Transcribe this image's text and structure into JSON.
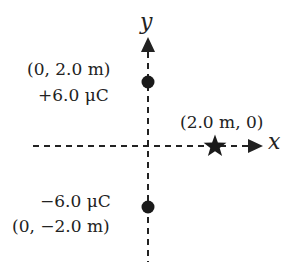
{
  "diagram": {
    "axes": {
      "x_label": "x",
      "y_label": "y",
      "style": "dashed",
      "color": "#222222"
    },
    "charges": [
      {
        "name": "positive-charge",
        "coordinate_label": "(0, 2.0 m)",
        "charge_label": "+6.0 μC",
        "x_m": 0,
        "y_m": 2.0,
        "charge_uC": 6.0,
        "marker": "filled-circle"
      },
      {
        "name": "negative-charge",
        "coordinate_label": "(0, −2.0 m)",
        "charge_label": "−6.0 μC",
        "x_m": 0,
        "y_m": -2.0,
        "charge_uC": -6.0,
        "marker": "filled-circle"
      }
    ],
    "point": {
      "name": "field-point",
      "coordinate_label": "(2.0 m, 0)",
      "x_m": 2.0,
      "y_m": 0,
      "marker": "star"
    }
  }
}
